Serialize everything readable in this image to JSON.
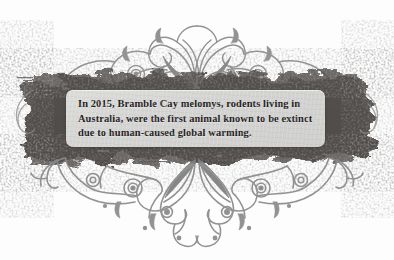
{
  "graphic": {
    "kind": "decorative-quote-card",
    "background_color": "#fdfdfd",
    "ornament_color": "#8d8d8d",
    "grunge_band_color": "#5a5754",
    "panel_color": "#d6d6d4",
    "text_color": "#24211e"
  },
  "quote": {
    "lines": [
      "In 2015, Bramble Cay melomys, rodents living in",
      "Australia, were the first animal known to be extinct",
      "due to human-caused global warming."
    ],
    "full_text": "In 2015, Bramble Cay melomys, rodents living in Australia, were the first animal known to be extinct due to human-caused global warming."
  },
  "decoration": {
    "top_ornament": "filigree-flourish-top",
    "bottom_ornament": "filigree-flourish-bottom",
    "left_ornament": "filigree-flourish-left",
    "right_ornament": "filigree-flourish-right",
    "band": "grunge-ink-band"
  }
}
